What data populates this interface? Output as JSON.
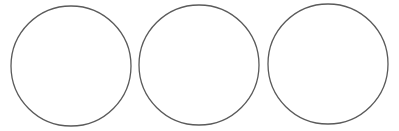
{
  "canvas": {
    "width": 399,
    "height": 131,
    "background": "#ffffff"
  },
  "stroke_color": "#5a5a5a",
  "stroke_width": 1.3,
  "circles": [
    {
      "cx": 71,
      "cy": 66,
      "r": 60
    },
    {
      "cx": 199,
      "cy": 65,
      "r": 60
    },
    {
      "cx": 328,
      "cy": 64,
      "r": 60
    }
  ]
}
